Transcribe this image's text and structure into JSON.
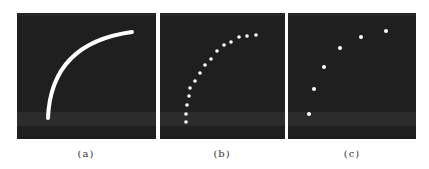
{
  "figure": {
    "panels": [
      {
        "id": "a",
        "label": "(a)",
        "kind": "continuous-curve",
        "curve_path": "M31 105 Q34 30 115 19"
      },
      {
        "id": "b",
        "label": "(b)",
        "kind": "dense-sampled-points",
        "points": [
          [
            26,
            109
          ],
          [
            26,
            101
          ],
          [
            27,
            92
          ],
          [
            29,
            83
          ],
          [
            30,
            75
          ],
          [
            35,
            68
          ],
          [
            40,
            60
          ],
          [
            45,
            52
          ],
          [
            51,
            46
          ],
          [
            57,
            38
          ],
          [
            64,
            32
          ],
          [
            71,
            29
          ],
          [
            79,
            24
          ],
          [
            87,
            23
          ],
          [
            96,
            22
          ]
        ]
      },
      {
        "id": "c",
        "label": "(c)",
        "kind": "sparse-sampled-points",
        "points": [
          [
            21,
            101
          ],
          [
            26,
            76
          ],
          [
            36,
            54
          ],
          [
            52,
            35
          ],
          [
            73,
            24
          ],
          [
            98,
            18
          ]
        ]
      }
    ],
    "colors": {
      "panel_bg": "#1f1f1f",
      "foreground": "#ffffff",
      "page_bg": "#ffffff"
    }
  }
}
